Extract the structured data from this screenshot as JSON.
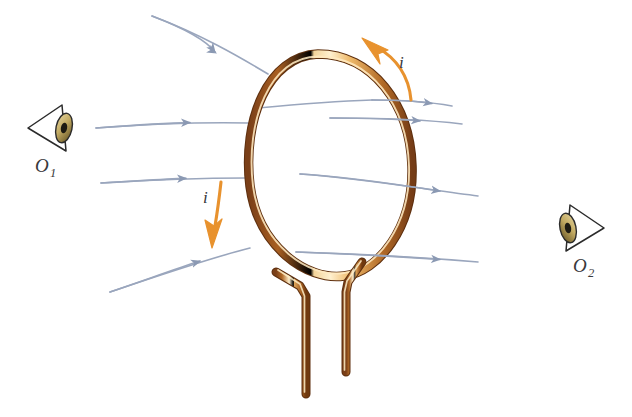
{
  "figure": {
    "background_color": "#ffffff",
    "width": 632,
    "height": 417
  },
  "colors": {
    "wire_dark": "#8a4a20",
    "wire_mid": "#c0762f",
    "wire_highlight": "#ffe6b4",
    "wire_outline": "#6d3a18",
    "current_arrow": "#e8922e",
    "current_arrow_dark": "#cf7a1c",
    "field_line": "#9aa6bd",
    "field_line_dark": "#7f8da8",
    "label_text": "#3a3a3c",
    "eye_outline": "#2b2b2b",
    "eye_iris_light": "#d8c58a",
    "eye_iris_dark": "#6b5a28",
    "eye_pupil": "#1a1a1a"
  },
  "loop": {
    "name": "current-loop",
    "description": "tilted oval copper wire loop with two vertical leads descending from the bottom"
  },
  "leads": {
    "left_lead_name": "loop-lead-left",
    "right_lead_name": "loop-lead-right"
  },
  "current_arrows": [
    {
      "id": "current-arrow-top",
      "label": "i",
      "direction": "counterclockwise-up-left",
      "position": "top-right of loop"
    },
    {
      "id": "current-arrow-left",
      "label": "i",
      "direction": "downward",
      "position": "left of loop"
    }
  ],
  "field_lines": [
    {
      "id": "field-line-1",
      "direction": "left-to-right",
      "position": "top"
    },
    {
      "id": "field-line-2",
      "direction": "left-to-right",
      "position": "upper-middle"
    },
    {
      "id": "field-line-3",
      "direction": "left-to-right",
      "position": "middle"
    },
    {
      "id": "field-line-4",
      "direction": "left-to-right",
      "position": "lower-middle"
    },
    {
      "id": "field-line-5",
      "direction": "left-to-right",
      "position": "bottom"
    }
  ],
  "observers": [
    {
      "id": "observer-1",
      "label": "O",
      "subscript": "1",
      "position": "left",
      "facing": "right"
    },
    {
      "id": "observer-2",
      "label": "O",
      "subscript": "2",
      "position": "right",
      "facing": "left"
    }
  ]
}
